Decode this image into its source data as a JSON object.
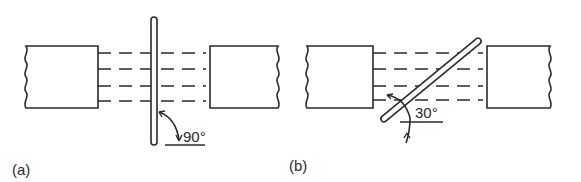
{
  "figure": {
    "panels": [
      {
        "id": "a",
        "label": "(a)",
        "angle_label": "90°",
        "angle_degrees": 90,
        "description": "Plate perpendicular to beam of parallel lines between two blocks"
      },
      {
        "id": "b",
        "label": "(b)",
        "angle_label": "30°",
        "angle_degrees": 30,
        "description": "Plate inclined at 30 degrees to beam of parallel lines between two blocks"
      }
    ],
    "colors": {
      "stroke": "#2a2a2a",
      "background": "#ffffff"
    },
    "dashed_line_count": 4
  }
}
